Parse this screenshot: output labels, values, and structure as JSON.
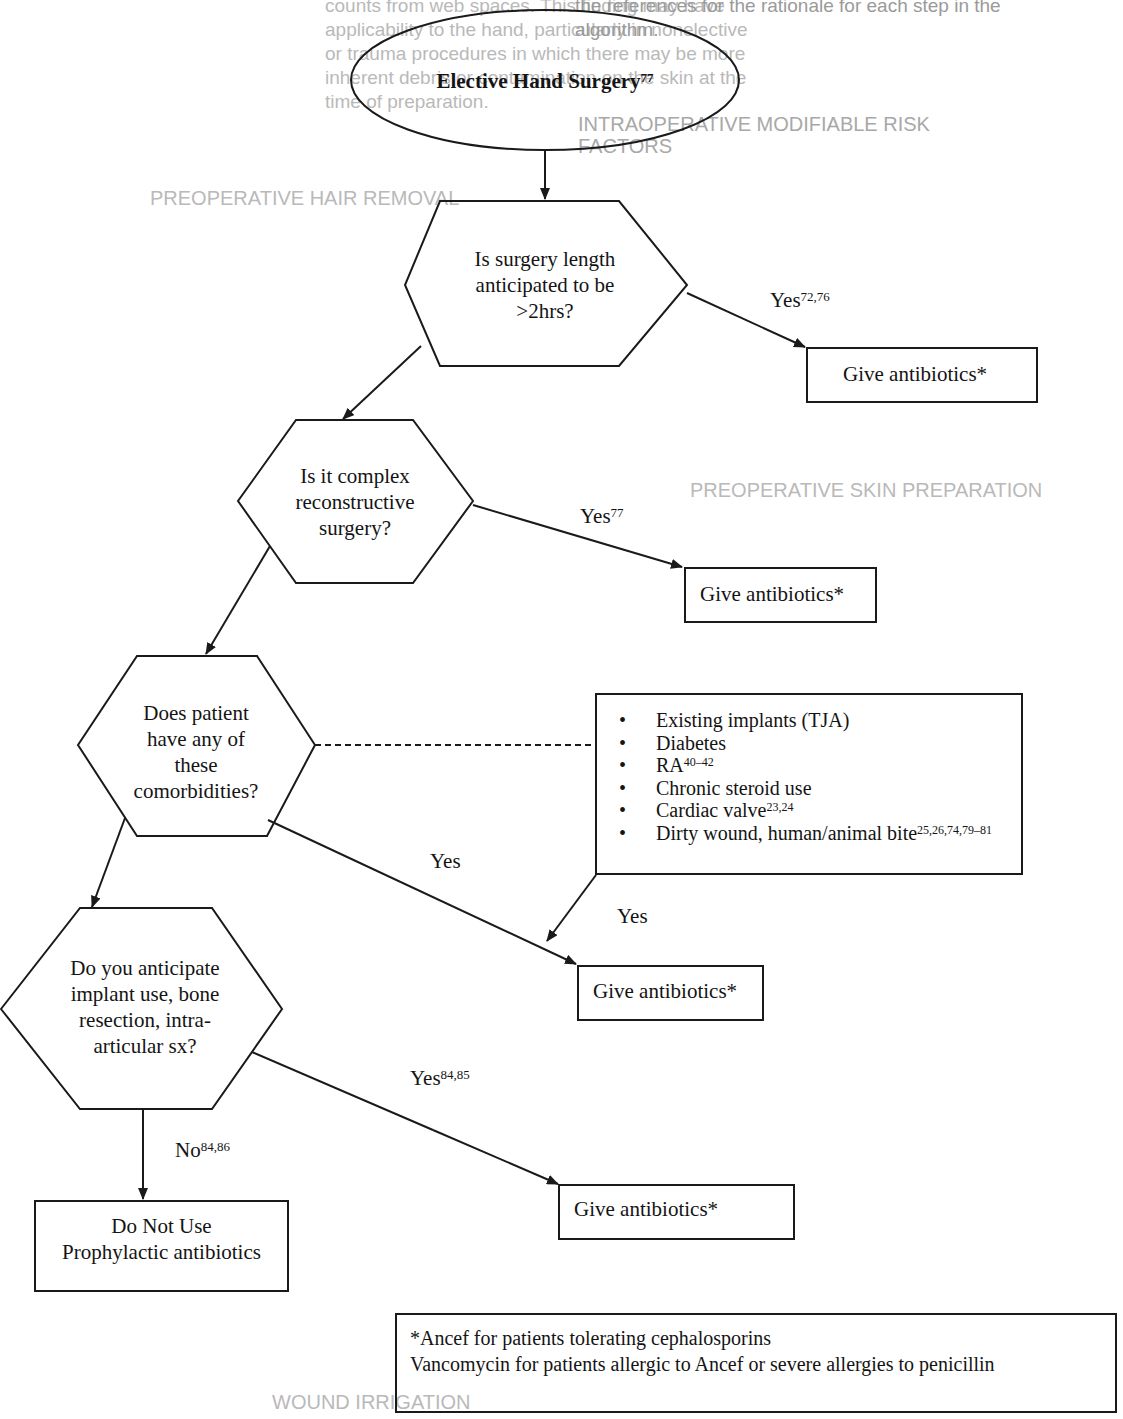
{
  "background_text": {
    "top_left_lines": [
      "counts from web spaces. This finding may have",
      "applicability to the hand, particularly in nonelective",
      "or trauma procedures in which there may be more",
      "inherent debris or contamination on the skin at the",
      "time of preparation."
    ],
    "top_right_lines": [
      "the references for the rationale for each step in the",
      "algorithm."
    ],
    "left_heading": "PREOPERATIVE HAIR REMOVAL",
    "right_heading_1": "INTRAOPERATIVE MODIFIABLE RISK",
    "right_heading_2": "FACTORS",
    "right_heading_3": "PREOPERATIVE SKIN PREPARATION",
    "bottom_heading": "WOUND IRRIGATION"
  },
  "flowchart": {
    "start": {
      "text": "Elective Hand Surgery",
      "ref": "77"
    },
    "q1": {
      "lines": [
        "Is surgery length",
        "anticipated to be",
        ">2hrs?"
      ]
    },
    "q1_yes": {
      "text": "Yes",
      "ref": "72,76"
    },
    "action1": {
      "text": "Give antibiotics*"
    },
    "q2": {
      "lines": [
        "Is it complex",
        "reconstructive",
        "surgery?"
      ]
    },
    "q2_yes": {
      "text": "Yes",
      "ref": "77"
    },
    "action2": {
      "text": "Give antibiotics*"
    },
    "q3": {
      "lines": [
        "Does patient",
        "have any of",
        "these",
        "comorbidities?"
      ]
    },
    "comorbidities": [
      {
        "text": "Existing implants (TJA)",
        "ref": ""
      },
      {
        "text": "Diabetes",
        "ref": ""
      },
      {
        "text": "RA",
        "ref": "40–42"
      },
      {
        "text": "Chronic steroid use",
        "ref": ""
      },
      {
        "text": "Cardiac valve",
        "ref": "23,24"
      },
      {
        "text": "Dirty wound, human/animal bite",
        "ref": "25,26,74,79–81"
      }
    ],
    "q3_yes": {
      "text": "Yes"
    },
    "comorb_yes": {
      "text": "Yes"
    },
    "action3": {
      "text": "Give antibiotics*"
    },
    "q4": {
      "lines": [
        "Do you anticipate",
        "implant use, bone",
        "resection, intra-",
        "articular sx?"
      ]
    },
    "q4_yes": {
      "text": "Yes",
      "ref": "84,85"
    },
    "action4": {
      "text": "Give antibiotics*"
    },
    "q4_no": {
      "text": "No",
      "ref": "84,86"
    },
    "end_no": {
      "lines": [
        "Do Not Use",
        "Prophylactic antibiotics"
      ]
    },
    "footnote": {
      "lines": [
        "*Ancef for patients tolerating cephalosporins",
        "Vancomycin for patients allergic to Ancef or severe allergies to penicillin"
      ]
    }
  },
  "colors": {
    "line": "#1a1a1a",
    "ghost_text": "#b9b9b9",
    "background": "#ffffff"
  }
}
